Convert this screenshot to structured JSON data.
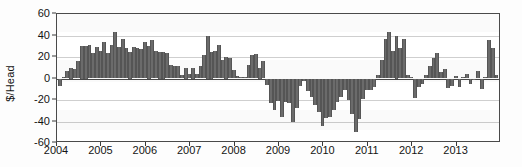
{
  "chart_data": {
    "type": "bar",
    "title": "",
    "subtitle": "",
    "xlabel": "",
    "ylabel": "$/Head",
    "ylim": [
      -60,
      60
    ],
    "yticks": [
      60,
      40,
      20,
      0,
      -20,
      -40,
      -60
    ],
    "ytick_labels": [
      "60",
      "40",
      "20",
      "0",
      "-20",
      "-40",
      "-60"
    ],
    "xticks": [
      2004,
      2005,
      2006,
      2007,
      2008,
      2009,
      2010,
      2011,
      2012,
      2013
    ],
    "xtick_labels": [
      "2004",
      "2005",
      "2006",
      "2007",
      "2008",
      "2009",
      "2010",
      "2011",
      "2012",
      "2013"
    ],
    "xlim": [
      2004,
      2014
    ],
    "grid": true,
    "grid_axis": "y",
    "legend": "none",
    "bar_color": "#6b6b6b",
    "axis_color": "#4a4a4a",
    "grid_color": "#cfcfcf",
    "x_start": 2004.0,
    "x_step": 0.08333,
    "categories": [
      "2004-01",
      "2004-02",
      "2004-03",
      "2004-04",
      "2004-05",
      "2004-06",
      "2004-07",
      "2004-08",
      "2004-09",
      "2004-10",
      "2004-11",
      "2004-12",
      "2005-01",
      "2005-02",
      "2005-03",
      "2005-04",
      "2005-05",
      "2005-06",
      "2005-07",
      "2005-08",
      "2005-09",
      "2005-10",
      "2005-11",
      "2005-12",
      "2006-01",
      "2006-02",
      "2006-03",
      "2006-04",
      "2006-05",
      "2006-06",
      "2006-07",
      "2006-08",
      "2006-09",
      "2006-10",
      "2006-11",
      "2006-12",
      "2007-01",
      "2007-02",
      "2007-03",
      "2007-04",
      "2007-05",
      "2007-06",
      "2007-07",
      "2007-08",
      "2007-09",
      "2007-10",
      "2007-11",
      "2007-12",
      "2008-01",
      "2008-02",
      "2008-03",
      "2008-04",
      "2008-05",
      "2008-06",
      "2008-07",
      "2008-08",
      "2008-09",
      "2008-10",
      "2008-11",
      "2008-12",
      "2009-01",
      "2009-02",
      "2009-03",
      "2009-04",
      "2009-05",
      "2009-06",
      "2009-07",
      "2009-08",
      "2009-09",
      "2009-10",
      "2009-11",
      "2009-12",
      "2010-01",
      "2010-02",
      "2010-03",
      "2010-04",
      "2010-05",
      "2010-06",
      "2010-07",
      "2010-08",
      "2010-09",
      "2010-10",
      "2010-11",
      "2010-12",
      "2011-01",
      "2011-02",
      "2011-03",
      "2011-04",
      "2011-05",
      "2011-06",
      "2011-07",
      "2011-08",
      "2011-09",
      "2011-10",
      "2011-11",
      "2011-12",
      "2012-01",
      "2012-02",
      "2012-03",
      "2012-04",
      "2012-05",
      "2012-06",
      "2012-07",
      "2012-08",
      "2012-09",
      "2012-10",
      "2012-11",
      "2012-12",
      "2013-01",
      "2013-02",
      "2013-03",
      "2013-04",
      "2013-05",
      "2013-06",
      "2013-07",
      "2013-08",
      "2013-09",
      "2013-10",
      "2013-11",
      "2013-12"
    ],
    "values": [
      -7,
      1,
      7,
      10,
      9,
      16,
      30,
      30,
      31,
      24,
      29,
      26,
      34,
      24,
      31,
      43,
      29,
      37,
      28,
      25,
      29,
      28,
      27,
      34,
      30,
      36,
      26,
      25,
      25,
      24,
      13,
      12,
      12,
      3,
      10,
      4,
      10,
      4,
      12,
      22,
      40,
      25,
      26,
      31,
      17,
      20,
      19,
      8,
      2,
      1,
      1,
      13,
      22,
      23,
      10,
      16,
      -6,
      -23,
      -29,
      -21,
      -36,
      -22,
      -23,
      -40,
      -27,
      -7,
      -2,
      -12,
      -17,
      -25,
      -31,
      -44,
      -37,
      -36,
      -29,
      -22,
      -17,
      -11,
      -20,
      -33,
      -50,
      -38,
      -19,
      -11,
      -11,
      -8,
      3,
      17,
      37,
      43,
      26,
      40,
      28,
      37,
      3,
      1,
      -18,
      -8,
      -5,
      3,
      12,
      19,
      24,
      6,
      9,
      -9,
      -7,
      2,
      -8,
      1,
      4,
      -5,
      -1,
      7,
      -10,
      1,
      36,
      28,
      3,
      -1
    ],
    "values_cont": [
      -32,
      -53,
      -42,
      -39,
      -28,
      -38,
      -33,
      -47,
      -23,
      -11,
      11,
      15,
      9,
      11,
      6
    ]
  }
}
